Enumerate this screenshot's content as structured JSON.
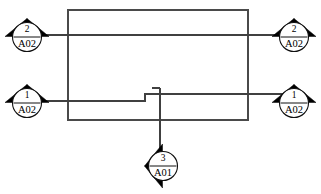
{
  "diagram": {
    "type": "electrical-schematic-continuation",
    "canvas": {
      "width": 321,
      "height": 194,
      "background": "#ffffff"
    },
    "colors": {
      "wire": "#404040",
      "enclosure": "#4a4a4a",
      "symbol_outline": "#101010",
      "arrow_fill": "#000000",
      "text": "#000000",
      "background": "#ffffff"
    },
    "enclosure": {
      "name": "panel-outline",
      "x": 68,
      "y": 10,
      "width": 180,
      "height": 110
    },
    "wires": [
      {
        "name": "wire-upper",
        "y": 35,
        "x_start": 28,
        "x_end": 292,
        "description": "upper horizontal conductor linking left and right tag 2 / A02"
      },
      {
        "name": "wire-lower",
        "y": 101,
        "x_start": 28,
        "x_end": 292,
        "description": "lower horizontal conductor with offset jog linking left and right tag 1 / A02"
      },
      {
        "name": "wire-jog",
        "description": "step offset in lower conductor rising to y=94 between x=145 and x=160"
      },
      {
        "name": "wire-branch-stub",
        "description": "short horizontal stub at y=88 from x=152 to x=160"
      },
      {
        "name": "wire-drop",
        "description": "vertical branch from y=88 down to y=150 feeding tag 3 / A01"
      }
    ],
    "symbols": [
      {
        "name": "tag-top-left",
        "number": "2",
        "sheet": "A02",
        "direction": "left",
        "orientation": "horizontal",
        "cx": 27,
        "cy": 37
      },
      {
        "name": "tag-top-right",
        "number": "2",
        "sheet": "A02",
        "direction": "right",
        "orientation": "horizontal",
        "cx": 294,
        "cy": 37
      },
      {
        "name": "tag-bottom-left",
        "number": "1",
        "sheet": "A02",
        "direction": "left",
        "orientation": "horizontal",
        "cx": 27,
        "cy": 103
      },
      {
        "name": "tag-bottom-right",
        "number": "1",
        "sheet": "A02",
        "direction": "right",
        "orientation": "horizontal",
        "cx": 294,
        "cy": 103
      },
      {
        "name": "tag-bottom-center",
        "number": "3",
        "sheet": "A01",
        "direction": "down",
        "orientation": "vertical",
        "cx": 163,
        "cy": 166
      }
    ]
  }
}
